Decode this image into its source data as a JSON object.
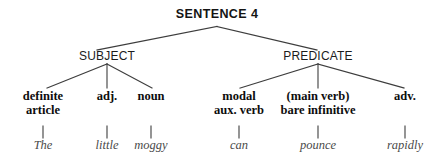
{
  "diagram": {
    "title": "SENTENCE 4",
    "line_color": "#3d3d3d",
    "text_color": "#0d0d0d",
    "word_color": "#4a4a4a",
    "constituents": [
      {
        "label": "SUBJECT"
      },
      {
        "label": "PREDICATE"
      }
    ],
    "categories": [
      {
        "line1": "definite",
        "line2": "article"
      },
      {
        "line1": "adj.",
        "line2": ""
      },
      {
        "line1": "noun",
        "line2": ""
      },
      {
        "line1": "modal",
        "line2": "aux. verb"
      },
      {
        "line1": "(main verb)",
        "line2": "bare infinitive"
      },
      {
        "line1": "adv.",
        "line2": ""
      }
    ],
    "words": [
      {
        "text": "The"
      },
      {
        "text": "little"
      },
      {
        "text": "moggy"
      },
      {
        "text": "can"
      },
      {
        "text": "pounce"
      },
      {
        "text": "rapidly"
      }
    ]
  }
}
